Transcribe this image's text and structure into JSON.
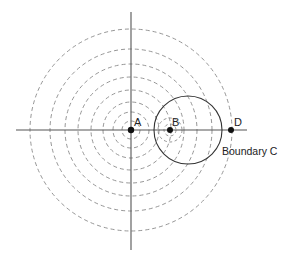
{
  "diagram": {
    "title": "",
    "colors": {
      "axis": "#555555",
      "dashed": "#8a8a8a",
      "boundary": "#333333",
      "point": "#111111",
      "text": "#222222"
    },
    "axes": {
      "horizontal": {
        "x1": 16,
        "x2": 247,
        "y": 130
      },
      "vertical": {
        "x": 131,
        "y1": 12,
        "y2": 250
      }
    },
    "center_A": {
      "x": 131,
      "y": 130
    },
    "dashed_circles_A": [
      9,
      18,
      28,
      40,
      53,
      66,
      81,
      101
    ],
    "center_B": {
      "x": 170,
      "y": 130
    },
    "dashed_circles_B": [
      6,
      12
    ],
    "boundary_C": {
      "cx": 188,
      "cy": 130,
      "r": 34
    },
    "point_D": {
      "x": 231,
      "y": 130
    },
    "labels": {
      "A": "A",
      "B": "B",
      "D": "D",
      "boundary": "Boundary C"
    }
  }
}
